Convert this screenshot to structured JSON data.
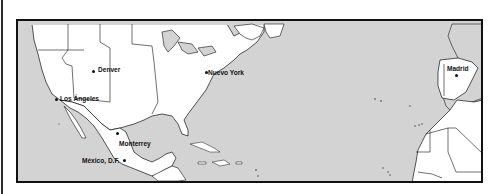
{
  "map": {
    "region": "North America, Atlantic Ocean, Iberia and West Africa",
    "colors": {
      "water": "#d3d3d3",
      "highlighted_land": "#ffffff",
      "other_land": "#d3d3d3",
      "outline": "#111111"
    },
    "cities": [
      {
        "name": "Denver",
        "x": 94,
        "y": 71
      },
      {
        "name": "Nuevo York",
        "x": 207,
        "y": 72
      },
      {
        "name": "Los Ángeles",
        "x": 57,
        "y": 99
      },
      {
        "name": "Monterrey",
        "x": 116,
        "y": 133
      },
      {
        "name": "México, D.F.",
        "x": 123,
        "y": 160
      },
      {
        "name": "Madrid",
        "x": 455,
        "y": 73
      }
    ]
  }
}
